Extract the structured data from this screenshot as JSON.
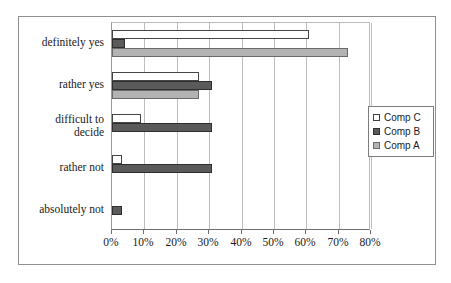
{
  "chart_data": {
    "type": "bar",
    "orientation": "horizontal",
    "title": "",
    "subtitle": "",
    "xlabel": "",
    "ylabel": "",
    "xlim": [
      0,
      80
    ],
    "xticks": [
      0,
      10,
      20,
      30,
      40,
      50,
      60,
      70,
      80
    ],
    "xtick_labels": [
      "0%",
      "10%",
      "20%",
      "30%",
      "40%",
      "50%",
      "60%",
      "70%",
      "80%"
    ],
    "grid": true,
    "grid_axis": "x",
    "legend_position": "right",
    "categories": [
      "definitely yes",
      "rather yes",
      "difficult to decide",
      "rather not",
      "absolutely not"
    ],
    "series": [
      {
        "name": "Comp C",
        "color": "#ffffff",
        "values": [
          61,
          27,
          9,
          3,
          0
        ]
      },
      {
        "name": "Comp B",
        "color": "#5a5a5a",
        "values": [
          4,
          31,
          31,
          31,
          3
        ]
      },
      {
        "name": "Comp A",
        "color": "#b3b3b3",
        "values": [
          73,
          27,
          0,
          0,
          0
        ]
      }
    ]
  },
  "legend": {
    "entries": [
      {
        "label": "Comp C",
        "swatch": "series-c"
      },
      {
        "label": "Comp B",
        "swatch": "series-b"
      },
      {
        "label": "Comp A",
        "swatch": "series-a"
      }
    ]
  },
  "axis": {
    "category_labels": [
      {
        "lines": [
          "definitely yes"
        ]
      },
      {
        "lines": [
          "rather yes"
        ]
      },
      {
        "lines": [
          "difficult to",
          "decide"
        ]
      },
      {
        "lines": [
          "rather not"
        ]
      },
      {
        "lines": [
          "absolutely not"
        ]
      }
    ]
  }
}
